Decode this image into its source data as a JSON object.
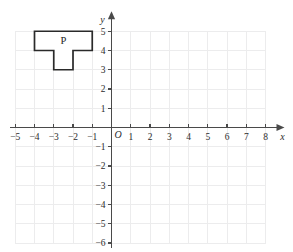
{
  "figure": {
    "background_color": "#ffffff",
    "grid_color": "#ececed",
    "axis_color": "#4a4a4a",
    "shape_stroke_color": "#2a2a2a"
  },
  "axes": {
    "x_label": "x",
    "y_label": "y",
    "origin_label": "O",
    "x_ticks": [
      {
        "value": -5,
        "label": "−5"
      },
      {
        "value": -4,
        "label": "−4"
      },
      {
        "value": -3,
        "label": "−3"
      },
      {
        "value": -2,
        "label": "−2"
      },
      {
        "value": -1,
        "label": "−1"
      },
      {
        "value": 1,
        "label": "1"
      },
      {
        "value": 2,
        "label": "2"
      },
      {
        "value": 3,
        "label": "3"
      },
      {
        "value": 4,
        "label": "4"
      },
      {
        "value": 5,
        "label": "5"
      },
      {
        "value": 6,
        "label": "6"
      },
      {
        "value": 7,
        "label": "7"
      },
      {
        "value": 8,
        "label": "8"
      }
    ],
    "y_ticks": [
      {
        "value": 5,
        "label": "5"
      },
      {
        "value": 4,
        "label": "4"
      },
      {
        "value": 3,
        "label": "3"
      },
      {
        "value": 2,
        "label": "2"
      },
      {
        "value": 1,
        "label": "1"
      },
      {
        "value": -1,
        "label": "−1"
      },
      {
        "value": -2,
        "label": "−2"
      },
      {
        "value": -3,
        "label": "−3"
      },
      {
        "value": -4,
        "label": "−4"
      },
      {
        "value": -5,
        "label": "−5"
      },
      {
        "value": -6,
        "label": "−6"
      }
    ],
    "x_range": [
      -5,
      8
    ],
    "y_range": [
      -6,
      5
    ]
  },
  "chart_data": {
    "type": "scatter",
    "title": "",
    "xlabel": "x",
    "ylabel": "y",
    "xlim": [
      -5,
      8
    ],
    "ylim": [
      -6,
      5
    ],
    "grid": true,
    "legend": "none",
    "shapes": [
      {
        "name": "P",
        "label": "P",
        "label_position": {
          "x": -2.5,
          "y": 4.5
        },
        "vertices": [
          {
            "x": -4,
            "y": 5
          },
          {
            "x": -1,
            "y": 5
          },
          {
            "x": -1,
            "y": 4
          },
          {
            "x": -2,
            "y": 4
          },
          {
            "x": -2,
            "y": 3
          },
          {
            "x": -3,
            "y": 3
          },
          {
            "x": -3,
            "y": 4
          },
          {
            "x": -4,
            "y": 4
          }
        ]
      }
    ]
  }
}
